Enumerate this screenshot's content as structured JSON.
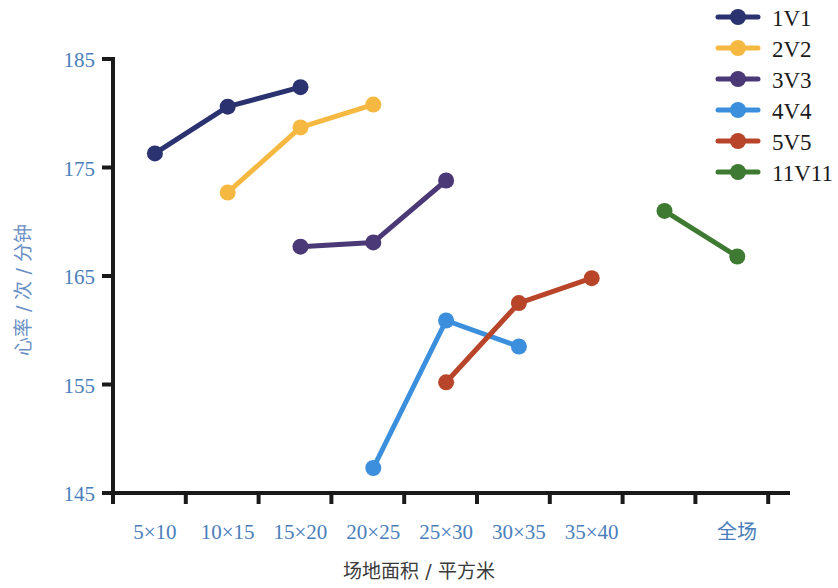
{
  "chart_data": {
    "type": "line",
    "title": "",
    "xlabel": "场地面积 / 平方米",
    "ylabel": "心率 / 次 / 分钟",
    "categories": [
      "5×10",
      "10×15",
      "15×20",
      "20×25",
      "25×30",
      "30×35",
      "35×40",
      "",
      "全场"
    ],
    "ylim": [
      145,
      185
    ],
    "yticks": [
      145,
      155,
      165,
      175,
      185
    ],
    "grid": false,
    "legend_position": "top-right",
    "series": [
      {
        "name": "1V1",
        "color": "#2a3270",
        "points": [
          {
            "x": "5×10",
            "y": 176.3
          },
          {
            "x": "10×15",
            "y": 180.6
          },
          {
            "x": "15×20",
            "y": 182.4
          }
        ]
      },
      {
        "name": "2V2",
        "color": "#f5b942",
        "points": [
          {
            "x": "10×15",
            "y": 172.7
          },
          {
            "x": "15×20",
            "y": 178.7
          },
          {
            "x": "20×25",
            "y": 180.8
          }
        ]
      },
      {
        "name": "3V3",
        "color": "#4b3876",
        "points": [
          {
            "x": "15×20",
            "y": 167.7
          },
          {
            "x": "20×25",
            "y": 168.1
          },
          {
            "x": "25×30",
            "y": 173.8
          }
        ]
      },
      {
        "name": "4V4",
        "color": "#3c8fdc",
        "points": [
          {
            "x": "20×25",
            "y": 147.3
          },
          {
            "x": "25×30",
            "y": 160.9
          },
          {
            "x": "30×35",
            "y": 158.5
          }
        ]
      },
      {
        "name": "5V5",
        "color": "#b8452a",
        "points": [
          {
            "x": "25×30",
            "y": 155.2
          },
          {
            "x": "30×35",
            "y": 162.5
          },
          {
            "x": "35×40",
            "y": 164.8
          }
        ]
      },
      {
        "name": "11V11",
        "color": "#3e7a32",
        "points": [
          {
            "x": "",
            "y": 171.0
          },
          {
            "x": "全场",
            "y": 166.8
          }
        ]
      }
    ]
  },
  "axes": {
    "y_title": "心率 / 次 / 分钟",
    "x_title": "场地面积 / 平方米",
    "y_tick_labels": [
      "185",
      "175",
      "165",
      "155",
      "145"
    ],
    "x_tick_labels": [
      "5×10",
      "10×15",
      "15×20",
      "20×25",
      "25×30",
      "30×35",
      "35×40",
      "全场"
    ]
  },
  "legend": {
    "items": [
      {
        "label": "1V1",
        "color": "#2a3270"
      },
      {
        "label": "2V2",
        "color": "#f5b942"
      },
      {
        "label": "3V3",
        "color": "#4b3876"
      },
      {
        "label": "4V4",
        "color": "#3c8fdc"
      },
      {
        "label": "5V5",
        "color": "#b8452a"
      },
      {
        "label": "11V11",
        "color": "#3e7a32"
      }
    ]
  },
  "colors": {
    "axis": "#1a1a1a",
    "tick_label": "#4a7ebb",
    "y_axis_title": "#6a8fc4",
    "x_axis_title": "#3a3a3a",
    "background": "#ffffff"
  }
}
